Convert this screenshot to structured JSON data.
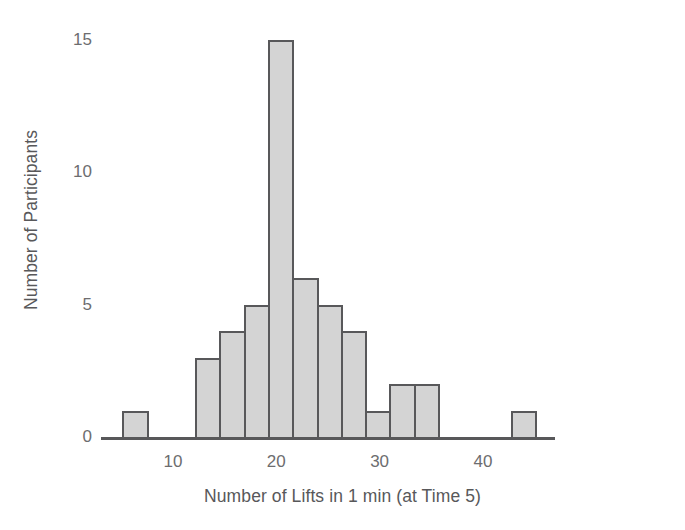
{
  "chart_data": {
    "type": "bar",
    "title": "",
    "subtitle": "",
    "xlabel": "Number of Lifts in 1 min (at Time 5)",
    "ylabel": "Number of Participants",
    "grid": false,
    "legend": "none",
    "xlim": [
      3.0,
      47.0
    ],
    "ylim": [
      0,
      15.6
    ],
    "x_ticks": [
      10,
      20,
      30,
      40
    ],
    "x_tick_labels": [
      "10",
      "20",
      "30",
      "40"
    ],
    "y_ticks": [
      0,
      5,
      10,
      15
    ],
    "y_tick_labels": [
      "0",
      "5",
      "10",
      "15"
    ],
    "bin_width": 2.35,
    "bins": [
      {
        "label": "5.1-7.4",
        "start": 5.1,
        "end": 7.45,
        "value": 1
      },
      {
        "label": "7.4-9.8",
        "start": 7.45,
        "end": 9.8,
        "value": 0
      },
      {
        "label": "9.8-12.2",
        "start": 9.8,
        "end": 12.15,
        "value": 0
      },
      {
        "label": "12.2-14.5",
        "start": 12.15,
        "end": 14.5,
        "value": 3
      },
      {
        "label": "14.5-16.9",
        "start": 14.5,
        "end": 16.85,
        "value": 4
      },
      {
        "label": "16.9-19.2",
        "start": 16.85,
        "end": 19.2,
        "value": 5
      },
      {
        "label": "19.2-21.6",
        "start": 19.2,
        "end": 21.55,
        "value": 15
      },
      {
        "label": "21.6-23.9",
        "start": 21.55,
        "end": 23.9,
        "value": 6
      },
      {
        "label": "23.9-26.3",
        "start": 23.9,
        "end": 26.25,
        "value": 5
      },
      {
        "label": "26.3-28.6",
        "start": 26.25,
        "end": 28.6,
        "value": 4
      },
      {
        "label": "28.6-31.0",
        "start": 28.6,
        "end": 30.95,
        "value": 1
      },
      {
        "label": "31.0-33.3",
        "start": 30.95,
        "end": 33.3,
        "value": 2
      },
      {
        "label": "33.3-35.7",
        "start": 33.3,
        "end": 35.65,
        "value": 2
      },
      {
        "label": "35.7-38.0",
        "start": 35.65,
        "end": 38.0,
        "value": 0
      },
      {
        "label": "38.0-40.4",
        "start": 38.0,
        "end": 40.35,
        "value": 0
      },
      {
        "label": "40.4-42.7",
        "start": 40.35,
        "end": 42.7,
        "value": 0
      },
      {
        "label": "42.7-45.1",
        "start": 42.7,
        "end": 45.05,
        "value": 1
      }
    ],
    "categories": [
      "5.1-7.4",
      "7.4-9.8",
      "9.8-12.2",
      "12.2-14.5",
      "14.5-16.9",
      "16.9-19.2",
      "19.2-21.6",
      "21.6-23.9",
      "23.9-26.3",
      "26.3-28.6",
      "28.6-31.0",
      "31.0-33.3",
      "33.3-35.7",
      "35.7-38.0",
      "38.0-40.4",
      "40.4-42.7",
      "42.7-45.1"
    ],
    "values": [
      1,
      0,
      0,
      3,
      4,
      5,
      15,
      6,
      5,
      4,
      1,
      2,
      2,
      0,
      0,
      0,
      1
    ],
    "colors": {
      "bar_fill": "#d4d4d4",
      "bar_stroke": "#58585a",
      "axis": "#58585a",
      "text": "#6d6d6f",
      "background": "#ffffff"
    }
  }
}
